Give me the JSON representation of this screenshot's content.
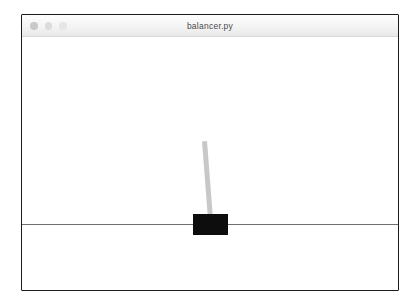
{
  "window": {
    "title": "balancer.py",
    "controls": [
      {
        "name": "close",
        "color": "#c9c9c9"
      },
      {
        "name": "minimize",
        "color": "#dcdcdc"
      },
      {
        "name": "maximize",
        "color": "#e6e6e6"
      }
    ],
    "border_color": "#1b1b1b",
    "canvas_background": "#ffffff"
  },
  "simulation": {
    "label": "cart-pole balancer",
    "ground_line_color": "#707070",
    "cart_color": "#0d0d0d",
    "pole_color": "#c8c8c8",
    "pole_angle_degrees": -4.4,
    "cart_x_px": 171,
    "cart_width_px": 35,
    "cart_height_px": 21,
    "pole_length_px": 78,
    "ground_y_px": 187
  }
}
